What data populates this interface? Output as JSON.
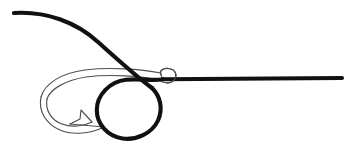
{
  "canvas": {
    "width": 358,
    "height": 145,
    "background": "#ffffff",
    "title": "Fishing hook knot diagram"
  },
  "colors": {
    "line": "#111111",
    "hook_outline": "#4f4f4f",
    "background": "#ffffff"
  },
  "figure": {
    "type": "line-drawing",
    "elements": [
      {
        "name": "tag-end-line",
        "label": "Tag end",
        "stroke": "#111111",
        "stroke_width": 4.1,
        "path": "M 14 13 C 46 11, 76 22, 98 42 C 118 60, 138 78, 152 88"
      },
      {
        "name": "knot-loop",
        "label": "Loop around shank",
        "stroke": "#111111",
        "stroke_width": 4.1,
        "path": "M 152 88 C 160 96, 163 108, 158 120 C 152 133, 136 140, 123 138 C 108 136, 97 124, 97 110 C 97 95, 110 82, 126 80 C 140 78, 152 81, 163 79"
      },
      {
        "name": "standing-line",
        "label": "Standing line",
        "stroke": "#111111",
        "stroke_width": 4.1,
        "path": "M 163 79 L 342 78"
      },
      {
        "name": "hook-eye",
        "label": "Hook eye",
        "stroke": "#4f4f4f",
        "path": "M 162 77 C 158 71, 164 68, 170 69 C 176 70, 177 76, 174 80 C 171 84, 164 84, 160 81"
      },
      {
        "name": "hook-shank-top",
        "label": "Hook shank (top edge)",
        "stroke": "#4f4f4f",
        "path": "M 161 73 C 140 69, 110 67, 85 70 C 62 73, 45 83, 41 97"
      },
      {
        "name": "hook-shank-bottom",
        "label": "Hook shank (bottom edge)",
        "stroke": "#4f4f4f",
        "path": "M 160 80 C 140 76, 110 74, 86 77 C 66 80, 50 89, 47 99"
      },
      {
        "name": "hook-bend-outer",
        "label": "Hook bend (outer edge)",
        "stroke": "#4f4f4f",
        "path": "M 41 97 C 38 111, 46 124, 60 130 C 74 136, 92 133, 104 127"
      },
      {
        "name": "hook-bend-inner",
        "label": "Hook bend (inner edge)",
        "stroke": "#4f4f4f",
        "path": "M 47 99 C 45 110, 51 120, 62 124 C 72 128, 84 126, 92 122"
      },
      {
        "name": "hook-barb",
        "label": "Barb",
        "stroke": "#4f4f4f",
        "path": "M 92 122 L 81 110 L 80 119 L 70 124"
      },
      {
        "name": "hook-point",
        "label": "Hook point",
        "stroke": "#4f4f4f",
        "path": "M 104 127 L 70 124"
      }
    ]
  }
}
